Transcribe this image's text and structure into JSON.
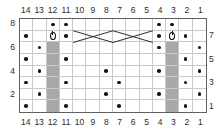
{
  "chart_data": {
    "type": "table",
    "columns": 14,
    "rows": 8,
    "column_labels_top": [
      "14",
      "13",
      "12",
      "11",
      "10",
      "9",
      "8",
      "7",
      "6",
      "5",
      "4",
      "3",
      "2",
      "1"
    ],
    "column_labels_bottom": [
      "14",
      "13",
      "12",
      "11",
      "10",
      "9",
      "8",
      "7",
      "6",
      "5",
      "4",
      "3",
      "2",
      "1"
    ],
    "row_labels_left": [
      "8",
      "",
      "6",
      "",
      "4",
      "",
      "2",
      ""
    ],
    "row_labels_right": [
      "",
      "7",
      "",
      "5",
      "",
      "3",
      "",
      "1"
    ],
    "row_order_top_to_bottom": [
      8,
      7,
      6,
      5,
      4,
      3,
      2,
      1
    ],
    "column_order_left_to_right": [
      14,
      13,
      12,
      11,
      10,
      9,
      8,
      7,
      6,
      5,
      4,
      3,
      2,
      1
    ],
    "legend": {
      "dot": "purl stitch",
      "oval": "yarn over / bobble",
      "shaded": "no stitch",
      "diagonal": "cable cross"
    },
    "colors": {
      "grid_line": "#c9c9c9",
      "border": "#606060",
      "shaded_cell": "#a8a8a8",
      "symbol": "#141414",
      "background": "#ffffff",
      "label_text": "#2b2b2b"
    },
    "cells": [
      {
        "row": 8,
        "symbols": {
          "12": "dot",
          "11": "dot",
          "4": "dot",
          "3": "dot"
        }
      },
      {
        "row": 7,
        "symbols": {
          "14": "dot",
          "12": "oval",
          "11": "dot",
          "4": "dot",
          "3": "oval",
          "2": "dot"
        }
      },
      {
        "row": 6,
        "symbols": {
          "13": "dot",
          "12": "shaded",
          "4": "dot",
          "3": "shaded",
          "1": "dot"
        }
      },
      {
        "row": 5,
        "symbols": {
          "14": "dot",
          "12": "shaded",
          "11": "dot",
          "3": "shaded",
          "2": "dot"
        }
      },
      {
        "row": 4,
        "symbols": {
          "13": "dot",
          "12": "shaded",
          "8": "dot",
          "4": "dot",
          "3": "shaded",
          "1": "dot"
        }
      },
      {
        "row": 3,
        "symbols": {
          "14": "dot",
          "12": "shaded",
          "11": "dot",
          "7": "dot",
          "3": "shaded",
          "2": "dot"
        }
      },
      {
        "row": 2,
        "symbols": {
          "13": "dot",
          "12": "shaded",
          "8": "dot",
          "4": "dot",
          "3": "shaded",
          "1": "dot"
        }
      },
      {
        "row": 1,
        "symbols": {
          "14": "dot",
          "12": "shaded",
          "11": "dot",
          "7": "dot",
          "3": "shaded",
          "2": "dot"
        }
      }
    ],
    "cables": [
      {
        "row": 7,
        "from_column": 10,
        "to_column": 8,
        "direction": "down-right"
      },
      {
        "row": 7,
        "from_column": 10,
        "to_column": 8,
        "direction": "up-right"
      },
      {
        "row": 7,
        "from_column": 7,
        "to_column": 5,
        "direction": "down-right"
      },
      {
        "row": 7,
        "from_column": 7,
        "to_column": 5,
        "direction": "up-right"
      }
    ]
  }
}
